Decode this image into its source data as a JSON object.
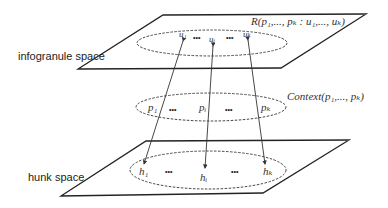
{
  "diagram": {
    "layers": [
      {
        "id": "infogranule",
        "label": "infogranule space",
        "relation_label": "R(p₁,..., pₖ : u₁,..., uₖ)",
        "elements": [
          "u₁",
          "•••",
          "uᵢ",
          "•••",
          "uₖ"
        ]
      },
      {
        "id": "context",
        "label": "Context(p₁,..., pₖ)",
        "elements": [
          "p₁",
          "•••",
          "pᵢ",
          "•••",
          "pₖ"
        ]
      },
      {
        "id": "hunk",
        "label": "hunk space",
        "elements": [
          "h₁",
          "•••",
          "hᵢ",
          "•••",
          "hₖ"
        ]
      }
    ],
    "arrows": [
      {
        "from": "u₁",
        "to": "h₁",
        "via": "p₁"
      },
      {
        "from": "uᵢ",
        "to": "hᵢ",
        "via": "pᵢ"
      },
      {
        "from": "uₖ",
        "to": "hₖ",
        "via": "pₖ"
      }
    ]
  }
}
